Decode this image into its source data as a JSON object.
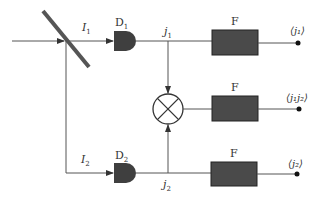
{
  "diagram": {
    "type": "intensity-interferometer-schematic",
    "colors": {
      "line": "#555555",
      "box_fill": "#4a4a4a",
      "detector_fill": "#3f3f3f",
      "splitter": "#555555",
      "text": "#333333"
    },
    "beam_labels": {
      "I1": {
        "base": "I",
        "sub": "1"
      },
      "I2": {
        "base": "I",
        "sub": "2"
      }
    },
    "detectors": [
      {
        "id": "D1",
        "base": "D",
        "sub": "1"
      },
      {
        "id": "D2",
        "base": "D",
        "sub": "2"
      }
    ],
    "signals": [
      {
        "id": "j1",
        "base": "j",
        "sub": "1"
      },
      {
        "id": "j2",
        "base": "j",
        "sub": "2"
      }
    ],
    "multiplier": {
      "symbol": "×"
    },
    "filters": [
      {
        "label": "F"
      },
      {
        "label": "F"
      },
      {
        "label": "F"
      }
    ],
    "outputs": [
      {
        "text": "<j1>",
        "display": "⟨j₁⟩"
      },
      {
        "text": "<j1j2>",
        "display": "⟨j₁j₂⟩"
      },
      {
        "text": "<j2>",
        "display": "⟨j₂⟩"
      }
    ]
  }
}
